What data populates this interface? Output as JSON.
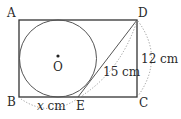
{
  "figure": {
    "type": "geometry-diagram",
    "colors": {
      "stroke": "#333333",
      "dotted": "#9a9a9a",
      "text": "#2a2a2a"
    },
    "points": {
      "A": "A",
      "B": "B",
      "C": "C",
      "D": "D",
      "E": "E",
      "O": "O"
    },
    "measurements": {
      "DE": "15 cm",
      "DC": "12 cm",
      "BE_value": "x",
      "BE_unit": " cm"
    }
  }
}
